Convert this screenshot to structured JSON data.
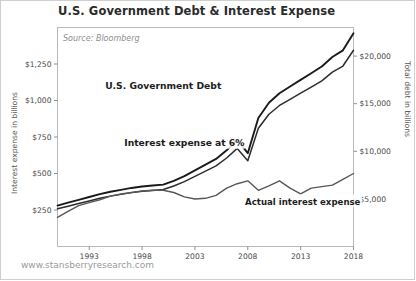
{
  "title": "U.S. Government Debt & Interest Expense",
  "footer": "www.stansberryresearch.com",
  "source_note": "Source: Bloomberg",
  "chart_data": {
    "type": "line",
    "title": "U.S. Government Debt & Interest Expense",
    "source": "Source: Bloomberg",
    "xlabel": "",
    "ylabel": "Interest expense in billions",
    "y2label": "Total debt in billions",
    "xlim": [
      1990,
      2018
    ],
    "xticks": [
      1993,
      1998,
      2003,
      2008,
      2013,
      2018
    ],
    "xtick_labels": [
      "1993",
      "1998",
      "2003",
      "2008",
      "2013",
      "2018"
    ],
    "ylim": [
      0,
      1500
    ],
    "yticks": [
      250,
      500,
      750,
      1000,
      1250
    ],
    "ytick_labels": [
      "$250",
      "$500",
      "$750",
      "$1,000",
      "$1,250"
    ],
    "y2lim": [
      0,
      23000
    ],
    "y2ticks": [
      5000,
      10000,
      15000,
      20000
    ],
    "y2tick_labels": [
      "$5,000",
      "$10,000",
      "$15,000",
      "$20,000"
    ],
    "grid": false,
    "legend_position": "inline-annotations",
    "annotations": [
      {
        "text": "U.S. Government Debt",
        "x": 2000.0,
        "y": 16800,
        "axis": "right"
      },
      {
        "text": "Interest expense at 6%",
        "x": 2002.0,
        "y": 700,
        "axis": "left"
      },
      {
        "text": "Actual interest expense",
        "x": 2013.2,
        "y": 300,
        "axis": "left"
      }
    ],
    "series": [
      {
        "name": "U.S. Government Debt",
        "axis": "right",
        "units": "billions USD",
        "x": [
          1990,
          1991,
          1992,
          1993,
          1994,
          1995,
          1996,
          1997,
          1998,
          1999,
          2000,
          2001,
          2002,
          2003,
          2004,
          2005,
          2006,
          2007,
          2008,
          2009,
          2010,
          2011,
          2012,
          2013,
          2014,
          2015,
          2016,
          2017,
          2018
        ],
        "values": [
          4300,
          4600,
          4900,
          5200,
          5500,
          5750,
          5950,
          6150,
          6300,
          6400,
          6500,
          6900,
          7400,
          8000,
          8600,
          9200,
          10100,
          11200,
          9800,
          13500,
          15100,
          16100,
          16800,
          17500,
          18200,
          18900,
          19900,
          20600,
          22400
        ]
      },
      {
        "name": "Interest expense at 6%",
        "axis": "left",
        "units": "billions USD",
        "x": [
          1990,
          1991,
          1992,
          1993,
          1994,
          1995,
          1996,
          1997,
          1998,
          1999,
          2000,
          2001,
          2002,
          2003,
          2004,
          2005,
          2006,
          2007,
          2008,
          2009,
          2010,
          2011,
          2012,
          2013,
          2014,
          2015,
          2016,
          2017,
          2018
        ],
        "values": [
          258,
          276,
          294,
          312,
          330,
          345,
          357,
          369,
          378,
          384,
          390,
          414,
          444,
          480,
          516,
          552,
          606,
          672,
          588,
          810,
          906,
          966,
          1008,
          1050,
          1092,
          1134,
          1194,
          1236,
          1344
        ]
      },
      {
        "name": "Actual interest expense",
        "axis": "left",
        "units": "billions USD",
        "x": [
          1990,
          1991,
          1992,
          1993,
          1994,
          1995,
          1996,
          1997,
          1998,
          1999,
          2000,
          2001,
          2002,
          2003,
          2004,
          2005,
          2006,
          2007,
          2008,
          2009,
          2010,
          2011,
          2012,
          2013,
          2014,
          2015,
          2016,
          2017,
          2018
        ],
        "values": [
          200,
          240,
          280,
          300,
          320,
          345,
          360,
          370,
          380,
          385,
          385,
          370,
          340,
          325,
          330,
          350,
          400,
          430,
          450,
          385,
          415,
          450,
          400,
          360,
          400,
          410,
          420,
          460,
          500
        ]
      }
    ]
  }
}
